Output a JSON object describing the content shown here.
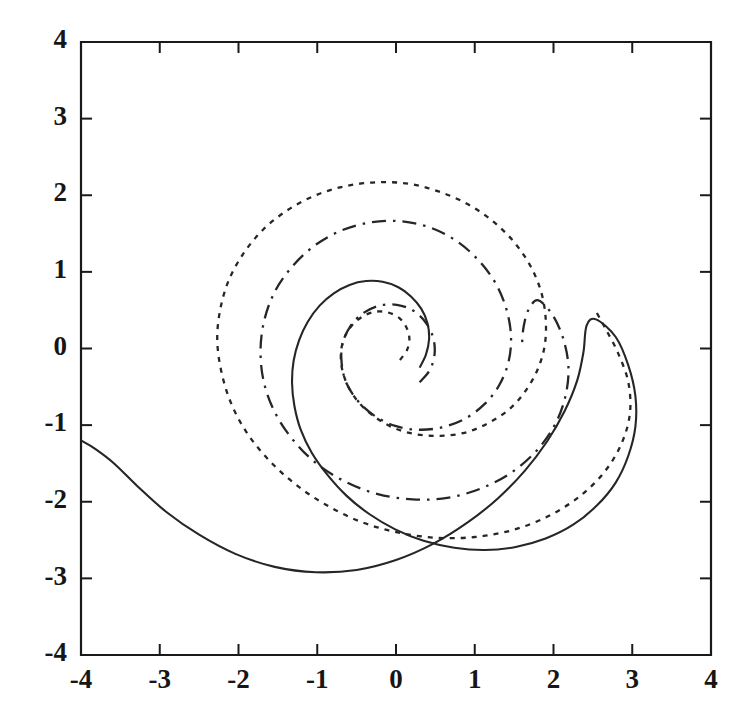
{
  "chart_data": {
    "type": "line",
    "title": "",
    "subtitle": "",
    "xlabel": "",
    "ylabel": "",
    "xlim": [
      -4,
      4
    ],
    "ylim": [
      -4,
      4
    ],
    "grid": false,
    "legend": "none",
    "x_ticks": [
      -4,
      -3,
      -2,
      -1,
      0,
      1,
      2,
      3,
      4
    ],
    "y_ticks": [
      -4,
      -3,
      -2,
      -1,
      0,
      1,
      2,
      3,
      4
    ],
    "x_tick_labels": [
      "-4",
      "-3",
      "-2",
      "-1",
      "0",
      "1",
      "2",
      "3",
      "4"
    ],
    "y_tick_labels": [
      "-4",
      "-3",
      "-2",
      "-1",
      "0",
      "1",
      "2",
      "3",
      "4"
    ],
    "axis_box": true,
    "background": "#ffffff",
    "line_color": "#262626",
    "series": [
      {
        "name": "solid-spiral",
        "style": "solid",
        "description": "Logarithmic spiral, inner terminus near (0.3,-0.25), unwinding counterclockwise to the left plot edge at (-4,-1.2)",
        "points": [
          [
            0.3,
            -0.25
          ],
          [
            0.38,
            -0.08
          ],
          [
            0.42,
            0.12
          ],
          [
            0.4,
            0.33
          ],
          [
            0.32,
            0.52
          ],
          [
            0.19,
            0.68
          ],
          [
            0.03,
            0.8
          ],
          [
            -0.17,
            0.87
          ],
          [
            -0.38,
            0.88
          ],
          [
            -0.59,
            0.83
          ],
          [
            -0.79,
            0.72
          ],
          [
            -0.97,
            0.56
          ],
          [
            -1.12,
            0.35
          ],
          [
            -1.23,
            0.11
          ],
          [
            -1.3,
            -0.16
          ],
          [
            -1.32,
            -0.45
          ],
          [
            -1.29,
            -0.75
          ],
          [
            -1.21,
            -1.06
          ],
          [
            -1.07,
            -1.36
          ],
          [
            -0.87,
            -1.65
          ],
          [
            -0.63,
            -1.92
          ],
          [
            -0.34,
            -2.16
          ],
          [
            -0.01,
            -2.36
          ],
          [
            0.35,
            -2.51
          ],
          [
            0.74,
            -2.6
          ],
          [
            1.13,
            -2.63
          ],
          [
            1.52,
            -2.59
          ],
          [
            1.9,
            -2.48
          ],
          [
            2.25,
            -2.3
          ],
          [
            2.55,
            -2.05
          ],
          [
            2.79,
            -1.75
          ],
          [
            2.95,
            -1.4
          ],
          [
            3.04,
            -1.02
          ],
          [
            3.04,
            -0.62
          ],
          [
            2.95,
            -0.22
          ],
          [
            2.79,
            0.15
          ],
          [
            2.54,
            0.38
          ],
          [
            2.42,
            0.3
          ],
          [
            2.38,
            -0.05
          ],
          [
            2.3,
            -0.42
          ],
          [
            2.14,
            -0.82
          ],
          [
            1.92,
            -1.21
          ],
          [
            1.64,
            -1.59
          ],
          [
            1.3,
            -1.95
          ],
          [
            0.91,
            -2.27
          ],
          [
            0.47,
            -2.55
          ],
          [
            0.0,
            -2.76
          ],
          [
            -0.5,
            -2.89
          ],
          [
            -1.02,
            -2.92
          ],
          [
            -1.54,
            -2.85
          ],
          [
            -2.04,
            -2.68
          ],
          [
            -2.5,
            -2.43
          ],
          [
            -2.92,
            -2.13
          ],
          [
            -3.28,
            -1.8
          ],
          [
            -3.58,
            -1.5
          ],
          [
            -3.82,
            -1.31
          ],
          [
            -4.0,
            -1.2
          ]
        ]
      },
      {
        "name": "dotted-spiral",
        "style": "dotted",
        "description": "Logarithmic spiral drawn with fine dots, inner terminus near (0.05,-0.15), unwinding counterclockwise; outer terminus near (2.52,0.52)",
        "points": [
          [
            0.05,
            -0.15
          ],
          [
            0.14,
            -0.02
          ],
          [
            0.17,
            0.13
          ],
          [
            0.13,
            0.28
          ],
          [
            0.04,
            0.4
          ],
          [
            -0.1,
            0.47
          ],
          [
            -0.26,
            0.48
          ],
          [
            -0.42,
            0.42
          ],
          [
            -0.56,
            0.3
          ],
          [
            -0.66,
            0.13
          ],
          [
            -0.7,
            -0.07
          ],
          [
            -0.68,
            -0.29
          ],
          [
            -0.6,
            -0.51
          ],
          [
            -0.46,
            -0.72
          ],
          [
            -0.26,
            -0.9
          ],
          [
            -0.02,
            -1.04
          ],
          [
            0.26,
            -1.12
          ],
          [
            0.56,
            -1.14
          ],
          [
            0.87,
            -1.1
          ],
          [
            1.16,
            -0.98
          ],
          [
            1.43,
            -0.8
          ],
          [
            1.64,
            -0.56
          ],
          [
            1.8,
            -0.27
          ],
          [
            1.89,
            0.05
          ],
          [
            1.9,
            0.4
          ],
          [
            1.84,
            0.75
          ],
          [
            1.7,
            1.09
          ],
          [
            1.49,
            1.4
          ],
          [
            1.22,
            1.67
          ],
          [
            0.9,
            1.89
          ],
          [
            0.54,
            2.05
          ],
          [
            0.16,
            2.15
          ],
          [
            -0.24,
            2.17
          ],
          [
            -0.64,
            2.12
          ],
          [
            -1.02,
            2.0
          ],
          [
            -1.37,
            1.81
          ],
          [
            -1.68,
            1.56
          ],
          [
            -1.93,
            1.25
          ],
          [
            -2.12,
            0.9
          ],
          [
            -2.23,
            0.52
          ],
          [
            -2.27,
            0.12
          ],
          [
            -2.22,
            -0.29
          ],
          [
            -2.1,
            -0.7
          ],
          [
            -1.9,
            -1.09
          ],
          [
            -1.62,
            -1.45
          ],
          [
            -1.28,
            -1.77
          ],
          [
            -0.89,
            -2.04
          ],
          [
            -0.45,
            -2.26
          ],
          [
            0.02,
            -2.4
          ],
          [
            0.51,
            -2.47
          ],
          [
            1.0,
            -2.46
          ],
          [
            1.48,
            -2.37
          ],
          [
            1.93,
            -2.19
          ],
          [
            2.32,
            -1.94
          ],
          [
            2.64,
            -1.62
          ],
          [
            2.86,
            -1.25
          ],
          [
            2.97,
            -0.85
          ],
          [
            2.95,
            -0.44
          ],
          [
            2.82,
            -0.06
          ],
          [
            2.66,
            0.26
          ],
          [
            2.52,
            0.52
          ]
        ]
      },
      {
        "name": "dash-dot-spiral",
        "style": "dashdot",
        "description": "Logarithmic spiral drawn with long-dash dot pattern, inner closed loop of radius about 0.4 around the origin, unwinding counterclockwise; outer terminus near (1.60,0.05)",
        "points": [
          [
            0.3,
            -0.44
          ],
          [
            0.43,
            -0.28
          ],
          [
            0.49,
            -0.07
          ],
          [
            0.47,
            0.15
          ],
          [
            0.37,
            0.35
          ],
          [
            0.21,
            0.5
          ],
          [
            0.01,
            0.57
          ],
          [
            -0.21,
            0.56
          ],
          [
            -0.42,
            0.46
          ],
          [
            -0.58,
            0.29
          ],
          [
            -0.68,
            0.06
          ],
          [
            -0.69,
            -0.19
          ],
          [
            -0.63,
            -0.45
          ],
          [
            -0.48,
            -0.69
          ],
          [
            -0.27,
            -0.88
          ],
          [
            -0.01,
            -1.01
          ],
          [
            0.28,
            -1.06
          ],
          [
            0.58,
            -1.03
          ],
          [
            0.87,
            -0.92
          ],
          [
            1.12,
            -0.73
          ],
          [
            1.31,
            -0.48
          ],
          [
            1.43,
            -0.17
          ],
          [
            1.46,
            0.17
          ],
          [
            1.4,
            0.52
          ],
          [
            1.26,
            0.86
          ],
          [
            1.04,
            1.16
          ],
          [
            0.76,
            1.41
          ],
          [
            0.43,
            1.58
          ],
          [
            0.07,
            1.66
          ],
          [
            -0.3,
            1.65
          ],
          [
            -0.67,
            1.55
          ],
          [
            -1.01,
            1.36
          ],
          [
            -1.3,
            1.09
          ],
          [
            -1.53,
            0.76
          ],
          [
            -1.67,
            0.38
          ],
          [
            -1.72,
            -0.02
          ],
          [
            -1.68,
            -0.43
          ],
          [
            -1.54,
            -0.83
          ],
          [
            -1.31,
            -1.19
          ],
          [
            -1.01,
            -1.5
          ],
          [
            -0.64,
            -1.74
          ],
          [
            -0.23,
            -1.9
          ],
          [
            0.21,
            -1.97
          ],
          [
            0.65,
            -1.95
          ],
          [
            1.07,
            -1.83
          ],
          [
            1.45,
            -1.63
          ],
          [
            1.77,
            -1.35
          ],
          [
            2.01,
            -1.01
          ],
          [
            2.15,
            -0.63
          ],
          [
            2.19,
            -0.24
          ],
          [
            2.12,
            0.14
          ],
          [
            1.98,
            0.45
          ],
          [
            1.8,
            0.63
          ],
          [
            1.68,
            0.5
          ],
          [
            1.62,
            0.28
          ],
          [
            1.6,
            0.05
          ]
        ]
      }
    ]
  },
  "axes": {
    "tick_direction": "in",
    "top_ticks": true,
    "right_ticks": true
  }
}
